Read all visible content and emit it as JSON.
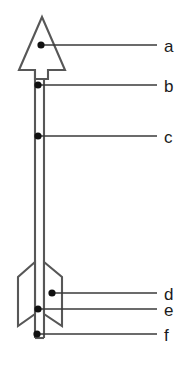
{
  "figure": {
    "background_color": "#ffffff",
    "outline_color": "#575757",
    "leader_color": "#3a3a3a",
    "marker_color": "#111111",
    "label_color": "#1b1b1b"
  },
  "labels": [
    {
      "key": "a",
      "text": "a",
      "part": "arrowhead",
      "text_x": 164,
      "text_y": 38,
      "dot_x": 41,
      "dot_y": 45,
      "line_x1": 41,
      "line_y1": 45,
      "line_x2": 157,
      "line_y2": 45
    },
    {
      "key": "b",
      "text": "b",
      "part": "shaft-upper-insert",
      "text_x": 164,
      "text_y": 78,
      "dot_x": 38,
      "dot_y": 85,
      "line_x1": 38,
      "line_y1": 85,
      "line_x2": 157,
      "line_y2": 85
    },
    {
      "key": "c",
      "text": "c",
      "part": "shaft",
      "text_x": 164,
      "text_y": 129,
      "dot_x": 38,
      "dot_y": 136,
      "line_x1": 38,
      "line_y1": 136,
      "line_x2": 157,
      "line_y2": 136
    },
    {
      "key": "d",
      "text": "d",
      "part": "fletching-vane",
      "text_x": 164,
      "text_y": 286,
      "dot_x": 52,
      "dot_y": 293,
      "line_x1": 52,
      "line_y1": 293,
      "line_x2": 157,
      "line_y2": 293
    },
    {
      "key": "e",
      "text": "e",
      "part": "fletching-base",
      "text_x": 164,
      "text_y": 302,
      "dot_x": 38,
      "dot_y": 309,
      "line_x1": 38,
      "line_y1": 309,
      "line_x2": 157,
      "line_y2": 309
    },
    {
      "key": "f",
      "text": "f",
      "part": "nock",
      "text_x": 164,
      "text_y": 327,
      "dot_x": 37,
      "dot_y": 334,
      "line_x1": 37,
      "line_y1": 334,
      "line_x2": 157,
      "line_y2": 334
    }
  ],
  "geometry": {
    "arrowhead_path": "M 42 17 L 65 70 L 48 70 L 48 79 L 35 79 L 35 70 L 19 70 Z",
    "shaft_left_x": 35,
    "shaft_right_x": 44,
    "shaft_top_y": 70,
    "shaft_bottom_y": 338,
    "fletch_left_path": "M 35 262 L 18 277 L 18 326 L 35 314 Z",
    "fletch_right_path": "M 44 262 L 62 277 L 62 326 L 44 314 Z",
    "nock_path": "M 35 326 L 35 338 L 44 338 L 44 326",
    "stroke_width": 2.1
  }
}
